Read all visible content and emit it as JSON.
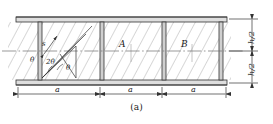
{
  "figure": {
    "caption": "(a)",
    "type": "engineering-diagram",
    "colors": {
      "line": "#333333",
      "hatch": "#8a8a8a",
      "flange_fill": "#d8d8d8",
      "stiffener_fill": "#c9c9c9",
      "background": "#ffffff",
      "centerline": "#777777"
    },
    "geometry": {
      "outer_left": 16,
      "outer_right": 227,
      "outer_top": 17,
      "outer_bottom": 85,
      "flange_thickness": 5,
      "web_top": 22,
      "web_bottom": 80,
      "centerline_y": 51,
      "stiffener_x": [
        38,
        100,
        162,
        219
      ],
      "stiffener_width": 4,
      "hatch_spacing": 7,
      "hatch_angle_deg": 28
    },
    "region_labels": [
      {
        "name": "region-a",
        "text": "A",
        "x": 120,
        "y": 44
      },
      {
        "name": "region-b",
        "text": "B",
        "x": 182,
        "y": 44
      }
    ],
    "angle_labels": [
      {
        "name": "theta-left",
        "text": "θ",
        "x": 32,
        "y": 60
      },
      {
        "name": "two-theta",
        "text": "2θ",
        "x": 48,
        "y": 62
      },
      {
        "name": "theta-right",
        "text": "θ",
        "x": 66,
        "y": 68
      }
    ],
    "spacing_label": {
      "name": "s-label",
      "text": "s",
      "x": 45,
      "y": 44
    },
    "width_dimensions": [
      {
        "name": "panel-width-1",
        "text": "a",
        "x1": 18,
        "x2": 98,
        "y": 93
      },
      {
        "name": "panel-width-2",
        "text": "a",
        "x1": 102,
        "x2": 160,
        "y": 93
      },
      {
        "name": "panel-width-3",
        "text": "a",
        "x1": 164,
        "x2": 226,
        "y": 93
      }
    ],
    "height_dimensions": [
      {
        "name": "half-depth-upper",
        "text": "h/2",
        "y1": 19,
        "y2": 50,
        "x": 246
      },
      {
        "name": "half-depth-lower",
        "text": "h/2",
        "y1": 52,
        "y2": 83,
        "x": 246
      }
    ]
  }
}
